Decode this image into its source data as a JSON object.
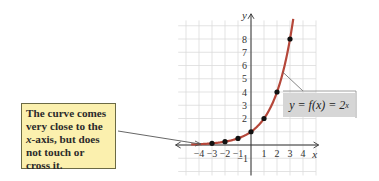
{
  "chart_data": {
    "type": "line",
    "title": "",
    "function_label": "y = f(x) = 2^x",
    "xlabel": "x",
    "ylabel": "y",
    "xlim": [
      -5,
      5
    ],
    "ylim": [
      -2,
      9
    ],
    "x_ticks": [
      -4,
      -3,
      -2,
      -1,
      1,
      2,
      3,
      4
    ],
    "y_ticks": [
      -1,
      1,
      2,
      3,
      4,
      5,
      6,
      7,
      8
    ],
    "y_tick_labels_shown": [
      -1,
      2,
      3,
      4,
      5,
      6,
      7,
      8
    ],
    "grid": true,
    "points": [
      {
        "x": -3,
        "y": 0.125
      },
      {
        "x": -2,
        "y": 0.25
      },
      {
        "x": -1,
        "y": 0.5
      },
      {
        "x": 0,
        "y": 1
      },
      {
        "x": 1,
        "y": 2
      },
      {
        "x": 2,
        "y": 4
      },
      {
        "x": 3,
        "y": 8
      }
    ],
    "curve_color": "#b5473a",
    "annotation": "The curve comes very close to the x-axis, but does not touch or cross it."
  },
  "callout": {
    "line1": "The curve comes",
    "line2": "very close to the",
    "line3_italic": "x",
    "line3_rest": "-axis, but does",
    "line4": "not touch or",
    "line5": "cross it."
  },
  "equation": {
    "lhs": "y = f(x) = 2",
    "exp": "x"
  },
  "axes": {
    "x_label": "x",
    "y_label": "y",
    "x_ticks": [
      "−4",
      "−3",
      "−2",
      "−1",
      "1",
      "2",
      "3",
      "4"
    ],
    "y_ticks": [
      "2",
      "3",
      "4",
      "5",
      "6",
      "7",
      "8"
    ],
    "neg_one": "−1"
  },
  "colors": {
    "curve": "#b5473a",
    "callout_fill": "#fbf0ae",
    "callout_border": "#6b6a45",
    "equation_fill": "#d6d6d6",
    "grid": "#dcdcdc"
  }
}
